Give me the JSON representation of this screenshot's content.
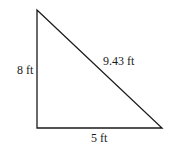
{
  "diagram": {
    "type": "right-triangle",
    "vertices": {
      "top": [
        37,
        10
      ],
      "bottom_left": [
        37,
        128
      ],
      "bottom_right": [
        162,
        128
      ]
    },
    "labels": {
      "vertical_side": "8 ft",
      "horizontal_side": "5 ft",
      "hypotenuse": "9.43 ft"
    },
    "stroke_color": "#1a1a1a"
  }
}
